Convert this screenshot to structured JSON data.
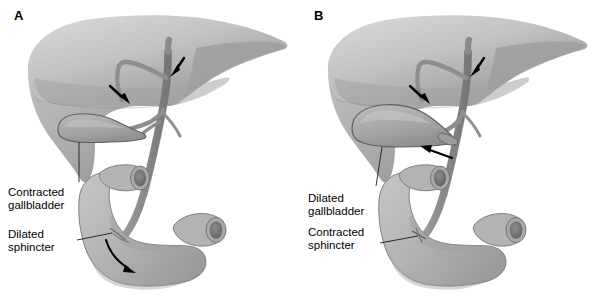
{
  "figure": {
    "background": "#ffffff",
    "width": 600,
    "height": 297,
    "type": "medical-illustration"
  },
  "colors": {
    "liver_light": "#c9c9c9",
    "liver_mid": "#b4b4b4",
    "liver_dark": "#9a9a9a",
    "liver_shadow": "#8d8d8d",
    "gallbladder": "#a9a9a9",
    "duct": "#8f8f8f",
    "duct_dark": "#7c7c7c",
    "duodenum": "#b9b9b9",
    "duodenum_shade": "#9d9d9d",
    "lumen": "#7a7a7a",
    "lumen_inner": "#6a6a6a",
    "outline": "#555555",
    "arrow": "#000000",
    "leader": "#1a1a1a",
    "text": "#000000"
  },
  "panels": [
    {
      "id": "A",
      "letter": "A",
      "letter_pos": {
        "x": 14,
        "y": 9
      },
      "state": "fasting-contracted-gallbladder",
      "labels": [
        {
          "name": "contracted-gallbladder",
          "lines": [
            "Contracted",
            "gallbladder"
          ],
          "text": "Contracted\ngallbladder",
          "x": 8,
          "y": 186
        },
        {
          "name": "dilated-sphincter",
          "lines": [
            "Dilated",
            "sphincter"
          ],
          "text": "Dilated\nsphincter",
          "x": 8,
          "y": 228
        }
      ],
      "arrows": [
        {
          "name": "arrow-right-hepatic-duct",
          "label": "arrow pointing down at hepatic duct"
        },
        {
          "name": "arrow-left-hepatic-duct",
          "label": "arrow pointing down-right at left hepatic duct"
        },
        {
          "name": "arrow-bile-flow-duodenum",
          "label": "curved arrow showing bile flowing into duodenum"
        }
      ],
      "leaders": [
        {
          "name": "leader-gallbladder"
        },
        {
          "name": "leader-sphincter"
        }
      ]
    },
    {
      "id": "B",
      "letter": "B",
      "letter_pos": {
        "x": 14,
        "y": 9
      },
      "state": "dilated-gallbladder-contracted-sphincter",
      "labels": [
        {
          "name": "dilated-gallbladder",
          "lines": [
            "Dilated",
            "gallbladder"
          ],
          "text": "Dilated\ngallbladder",
          "x": 8,
          "y": 192
        },
        {
          "name": "contracted-sphincter",
          "lines": [
            "Contracted",
            "sphincter"
          ],
          "text": "Contracted\nsphincter",
          "x": 8,
          "y": 226
        }
      ],
      "arrows": [
        {
          "name": "arrow-right-hepatic-duct",
          "label": "arrow pointing down at hepatic duct"
        },
        {
          "name": "arrow-left-hepatic-duct",
          "label": "arrow pointing down-right at left hepatic duct"
        },
        {
          "name": "arrow-cystic-duct-filling",
          "label": "arrow pointing up-left toward cystic duct junction"
        }
      ],
      "leaders": [
        {
          "name": "leader-gallbladder"
        },
        {
          "name": "leader-sphincter"
        }
      ]
    }
  ]
}
